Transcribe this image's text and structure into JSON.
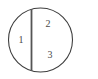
{
  "figure": {
    "background_color": "#ffffff",
    "outline_color": "#3f3f3f",
    "chord_color": "#555555",
    "label_color": "#4a4a4a",
    "circle": {
      "center_x": 40.5,
      "center_y": 40,
      "radius": 32,
      "stroke_width": 1.1
    },
    "chord": {
      "orientation": "vertical",
      "x": 31.5,
      "y_top": 9,
      "y_bottom": 71,
      "stroke_width": 1.8
    },
    "labels": [
      {
        "id": "region-1",
        "text": "1",
        "x": 21,
        "y": 40
      },
      {
        "id": "region-2",
        "text": "2",
        "x": 48,
        "y": 24
      },
      {
        "id": "region-3",
        "text": "3",
        "x": 50,
        "y": 55
      }
    ]
  }
}
